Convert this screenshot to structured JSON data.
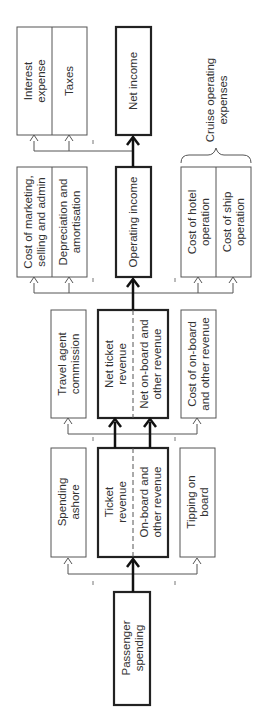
{
  "diagram": {
    "orientation": "rotated-90-ccw",
    "nodes": {
      "passenger_spending": [
        "Passenger",
        "spending"
      ],
      "spending_ashore": [
        "Spending",
        "ashore"
      ],
      "ticket_revenue": [
        "Ticket",
        "revenue"
      ],
      "onboard_revenue": [
        "On-board and",
        "other revenue"
      ],
      "tipping_on_board": [
        "Tipping on",
        "board"
      ],
      "travel_agent_commission": [
        "Travel agent",
        "commission"
      ],
      "net_ticket_revenue": [
        "Net ticket",
        "revenue"
      ],
      "net_onboard_revenue": [
        "Net on-board and",
        "other revenue"
      ],
      "cost_onboard": [
        "Cost of on-board",
        "and other revenue"
      ],
      "cost_marketing": [
        "Cost of marketing,",
        "selling and admin"
      ],
      "depreciation": [
        "Depreciation and",
        "amortisation"
      ],
      "operating_income": [
        "Operating income"
      ],
      "cost_hotel": [
        "Cost of hotel",
        "operation"
      ],
      "cost_ship": [
        "Cost of ship",
        "operation"
      ],
      "interest_expense": [
        "Interest",
        "expense"
      ],
      "taxes": [
        "Taxes"
      ],
      "net_income": [
        "Net income"
      ],
      "cruise_operating_expenses": [
        "Cruise operating",
        "expenses"
      ]
    },
    "flows": [
      {
        "from": "Passenger spending",
        "to": "Ticket revenue / On-board and other revenue",
        "weight": "main"
      },
      {
        "from": "Passenger spending",
        "to": "Spending ashore",
        "weight": "leakage"
      },
      {
        "from": "Passenger spending",
        "to": "Tipping on board",
        "weight": "leakage"
      },
      {
        "from": "Ticket revenue",
        "to": "Net ticket revenue",
        "weight": "main"
      },
      {
        "from": "On-board and other revenue",
        "to": "Net on-board and other revenue",
        "weight": "main"
      },
      {
        "from": "Ticket revenue",
        "to": "Travel agent commission",
        "weight": "deduction"
      },
      {
        "from": "On-board and other revenue",
        "to": "Cost of on-board and other revenue",
        "weight": "deduction"
      },
      {
        "from": "Net revenue",
        "to": "Operating income",
        "weight": "main"
      },
      {
        "from": "Net revenue",
        "to": "Cost of marketing, selling and admin",
        "weight": "deduction"
      },
      {
        "from": "Net revenue",
        "to": "Depreciation and amortisation",
        "weight": "deduction"
      },
      {
        "from": "Net revenue",
        "to": "Cost of hotel operation",
        "weight": "deduction"
      },
      {
        "from": "Net revenue",
        "to": "Cost of ship operation",
        "weight": "deduction"
      },
      {
        "from": "Operating income",
        "to": "Net income",
        "weight": "main"
      },
      {
        "from": "Operating income",
        "to": "Interest expense",
        "weight": "deduction"
      },
      {
        "from": "Operating income",
        "to": "Taxes",
        "weight": "deduction"
      }
    ]
  }
}
